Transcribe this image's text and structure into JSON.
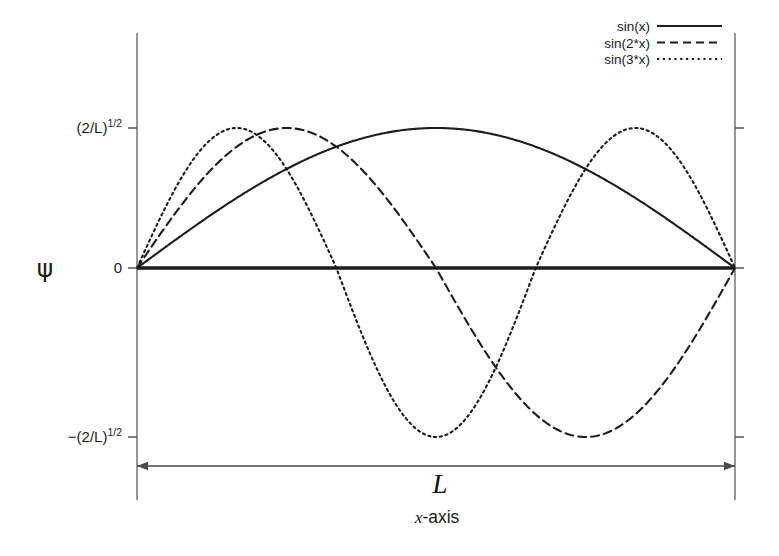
{
  "figure": {
    "background_color": "#ffffff",
    "ink_color": "#1d1d1d",
    "axis_color": "#7c7c7c"
  },
  "axes": {
    "y_symbol": "ψ",
    "x_title_italic": "x",
    "x_title_rest": "-axis",
    "y_ticks": [
      {
        "label_base": "(2/L)",
        "label_sup": "1/2",
        "value": 1
      },
      {
        "label_base": "0",
        "label_sup": "",
        "value": 0
      },
      {
        "label_base": "−(2/L)",
        "label_sup": "1/2",
        "value": -1
      }
    ]
  },
  "span_annotation": {
    "label": "L",
    "from_value": 0,
    "to_value": 1
  },
  "legend": {
    "position": "top-right",
    "entries": [
      {
        "label": "sin(x)",
        "style": "solid"
      },
      {
        "label": "sin(2*x)",
        "style": "dashed"
      },
      {
        "label": "sin(3*x)",
        "style": "dotted"
      }
    ]
  },
  "chart_data": {
    "type": "line",
    "title": "",
    "subtitle": "",
    "xlabel": "x-axis",
    "ylabel": "ψ",
    "xlim": [
      0,
      1
    ],
    "ylim": [
      -1.18,
      1.45
    ],
    "grid": false,
    "legend_position": "top-right",
    "x_tick_labels": [],
    "y_tick_labels": [
      "(2/L)^1/2",
      "0",
      "-(2/L)^1/2"
    ],
    "y_tick_values": [
      1,
      0,
      -1
    ],
    "annotations": [
      {
        "text": "L",
        "type": "double-arrow-span",
        "from_x": 0,
        "to_x": 1,
        "y": -1.28
      }
    ],
    "series": [
      {
        "name": "sin(x)",
        "style": "solid",
        "n": 1,
        "formula": "sin(1*pi*x/L)",
        "x": [
          0,
          0.05,
          0.1,
          0.15,
          0.2,
          0.25,
          0.3,
          0.35,
          0.4,
          0.45,
          0.5,
          0.55,
          0.6,
          0.65,
          0.7,
          0.75,
          0.8,
          0.85,
          0.9,
          0.95,
          1
        ],
        "values": [
          0,
          0.156,
          0.309,
          0.454,
          0.588,
          0.707,
          0.809,
          0.891,
          0.951,
          0.988,
          1,
          0.988,
          0.951,
          0.891,
          0.809,
          0.707,
          0.588,
          0.454,
          0.309,
          0.156,
          0
        ]
      },
      {
        "name": "sin(2*x)",
        "style": "dashed",
        "n": 2,
        "formula": "sin(2*pi*x/L)",
        "x": [
          0,
          0.05,
          0.1,
          0.15,
          0.2,
          0.25,
          0.3,
          0.35,
          0.4,
          0.45,
          0.5,
          0.55,
          0.6,
          0.65,
          0.7,
          0.75,
          0.8,
          0.85,
          0.9,
          0.95,
          1
        ],
        "values": [
          0,
          0.309,
          0.588,
          0.809,
          0.951,
          1,
          0.951,
          0.809,
          0.588,
          0.309,
          0,
          -0.309,
          -0.588,
          -0.809,
          -0.951,
          -1,
          -0.951,
          -0.809,
          -0.588,
          -0.309,
          0
        ]
      },
      {
        "name": "sin(3*x)",
        "style": "dotted",
        "n": 3,
        "formula": "sin(3*pi*x/L)",
        "x": [
          0,
          0.05,
          0.1,
          0.15,
          0.2,
          0.25,
          0.3,
          0.35,
          0.4,
          0.45,
          0.5,
          0.55,
          0.6,
          0.65,
          0.7,
          0.75,
          0.8,
          0.85,
          0.9,
          0.95,
          1
        ],
        "values": [
          0,
          0.454,
          0.809,
          0.988,
          0.951,
          0.707,
          0.309,
          -0.156,
          -0.588,
          -0.891,
          -1,
          -0.891,
          -0.588,
          -0.156,
          0.309,
          0.707,
          0.951,
          0.988,
          0.809,
          0.454,
          0
        ]
      }
    ]
  }
}
